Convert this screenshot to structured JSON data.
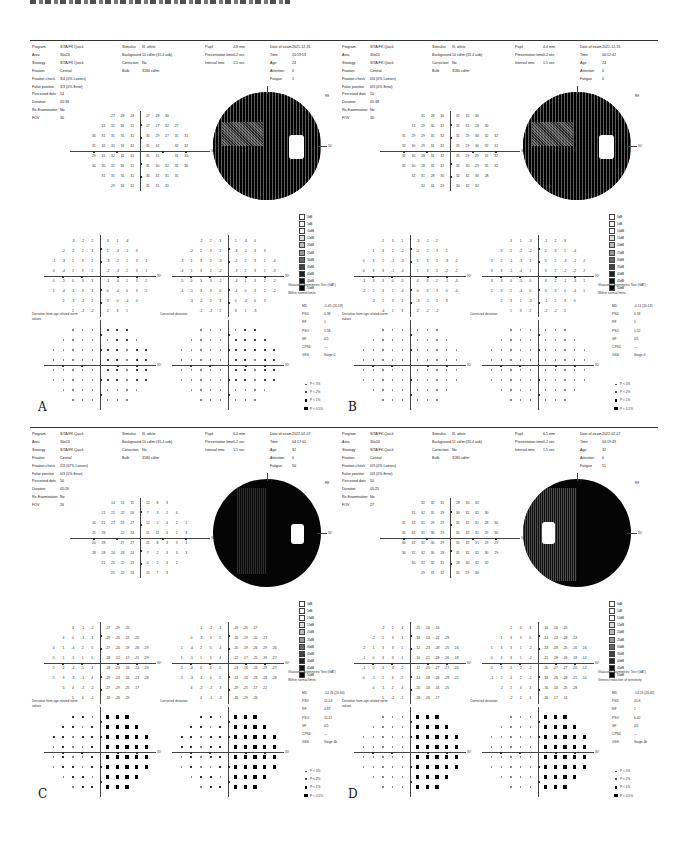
{
  "figure": {
    "caption_fragment": ""
  },
  "panels": [
    {
      "letter": "A",
      "header": {
        "program": "SITA/FK Quick",
        "area": "30x24",
        "strategy": "SITA/FK Quick",
        "fixation": "Central",
        "fixation_check": "3/4 (0% Losses)",
        "false_positive": "3/3 (0% Error)",
        "perceived_dots": "54",
        "duration": "05:38",
        "re_examination": "No",
        "fov": "30",
        "stimulus": "III, white",
        "background": "10 cd/m²(31.4 asb)",
        "correction": "No",
        "bulb": "3180 cd/m²",
        "pupil": "4.8 mm",
        "presentation_time": "0.2 sec",
        "interval_time": "1.5 sec",
        "date_of_exam": "2021-12-31",
        "time": "20:59:53",
        "age": "24",
        "attention": "0",
        "fatigue": "1"
      },
      "indices": {
        "ght": "Glaucoma Asymmetric Test (GAT)",
        "ght_result": "Within normal limits",
        "md": "-0.45 (20.18)",
        "psd": "0.38",
        "rf": "1",
        "pso": "1.58",
        "sf": "0/1",
        "cpsd": "—",
        "gss": "Stage 0"
      },
      "greymap_style": "patchy"
    },
    {
      "letter": "B",
      "header": {
        "program": "SITA/FK Quick",
        "area": "30x24",
        "strategy": "SITA/FK Quick",
        "fixation": "Central",
        "fixation_check": "0/4 (0% Losses)",
        "false_positive": "0/3 (0% Error)",
        "perceived_dots": "50",
        "duration": "05:38",
        "re_examination": "No",
        "fov": "30",
        "stimulus": "III, white",
        "background": "10 cd/m²(31.4 asb)",
        "correction": "No",
        "bulb": "3180 cd/m²",
        "pupil": "4.4 mm",
        "presentation_time": "0.2 sec",
        "interval_time": "1.5 sec",
        "date_of_exam": "2021-12-31",
        "time": "00:12:42",
        "age": "24",
        "attention": "0",
        "fatigue": "0"
      },
      "indices": {
        "ght": "Glaucoma Asymmetric Test (GAT)",
        "ght_result": "Within normal limits",
        "md": "-0.11 (20.18)",
        "psd": "0.58",
        "rf": "1",
        "pso": "1.52",
        "sf": "0/1",
        "cpsd": "—",
        "gss": "Stage 0"
      },
      "greymap_style": "patchy"
    },
    {
      "letter": "C",
      "header": {
        "program": "SITA/FK Quick",
        "area": "30x24",
        "strategy": "SITA/FK Quick",
        "fixation": "Central",
        "fixation_check": "2/3 (67% Losses)",
        "false_positive": "0/3 (0% Error)",
        "perceived_dots": "50",
        "duration": "05:26",
        "re_examination": "No",
        "fov": "26",
        "stimulus": "III, white",
        "background": "10 cd/m²(31.4 asb)",
        "correction": "No",
        "bulb": "3180 cd/m²",
        "pupil": "6.0 mm",
        "presentation_time": "0.2 sec",
        "interval_time": "1.5 sec",
        "date_of_exam": "2022-02-07",
        "time": "04:17:01",
        "age": "32",
        "attention": "0",
        "fatigue": "50"
      },
      "indices": {
        "ght": "Glaucoma Asymmetric Test (GAT)",
        "ght_result": "Within normal limits",
        "md": "-14.76 (20.60)",
        "psd": "15.03",
        "rf": "0.87",
        "pso": "15.11",
        "sf": "0/1",
        "cpsd": "—",
        "gss": "Stage 4b"
      },
      "greymap_style": "dark-left-patch"
    },
    {
      "letter": "D",
      "header": {
        "program": "SITA/FK Quick",
        "area": "30x24",
        "strategy": "SITA/FK Quick",
        "fixation": "Central",
        "fixation_check": "0/3 (0% Losses)",
        "false_positive": "0/3 (0% Error)",
        "perceived_dots": "50",
        "duration": "05:25",
        "re_examination": "No",
        "fov": "27",
        "stimulus": "III, white",
        "background": "11 cd/m²(31.4 asb)",
        "correction": "No",
        "bulb": "3180 cd/m²",
        "pupil": "6.5 mm",
        "presentation_time": "0.2 sec",
        "interval_time": "1.5 sec",
        "date_of_exam": "2022-02-07",
        "time": "04:19:49",
        "age": "32",
        "attention": "0",
        "fatigue": "51"
      },
      "indices": {
        "ght": "Glaucoma Asymmetric Test (GAT)",
        "ght_result": "General reduction of sensitivity",
        "md": "-14.23 (26.82)",
        "psd": "15.8",
        "rf": "1",
        "pso": "6.42",
        "sf": "0/1",
        "cpsd": "—",
        "gss": "Stage 4b"
      },
      "greymap_style": "dark-right-patch"
    }
  ],
  "labels": {
    "program": "Program",
    "area": "Area",
    "strategy": "Strategy",
    "fixation": "Fixation",
    "fixation_check": "Fixation check",
    "false_positive": "False positive",
    "perceived_dots": "Perceived dots",
    "duration": "Duration",
    "re_examination": "Re-Examination",
    "fov": "FOV",
    "stimulus": "Stimulus",
    "background": "Background",
    "correction": "Correction",
    "bulb": "Bulb",
    "pupil": "Pupil",
    "presentation_time": "Presentation time",
    "interval_time": "Interval time",
    "date_of_exam": "Date of exam",
    "time": "Time",
    "age": "Age",
    "attention": "Attention",
    "fatigue": "Fatigue",
    "md": "MD",
    "psd": "PSD",
    "rf": "RF",
    "pso": "PSO",
    "sf": "SF",
    "cpsd": "CPSD",
    "gss": "GSS",
    "deviation_total": "Deviation from age related norm values",
    "deviation_pattern": "Corrected deviation",
    "axis_30": "30°",
    "eye": "RE"
  },
  "greyscale_legend": [
    "0dB",
    "5dB",
    "10dB",
    "15dB",
    "20dB",
    "25dB",
    "30dB",
    "35dB",
    "40dB",
    "45dB",
    "50dB"
  ],
  "probability_legend": [
    "P < 5%",
    "P < 2%",
    "P < 1%",
    "P < 0.5%"
  ],
  "threshold_values": {
    "A": [
      [
        27,
        28,
        28,
        27,
        28,
        30
      ],
      [
        31,
        31,
        31,
        31,
        27,
        27,
        32,
        27
      ],
      [
        30,
        31,
        31,
        31,
        31,
        30,
        29,
        27,
        31,
        31
      ],
      [
        31,
        32,
        31,
        31,
        32,
        31,
        32,
        null,
        32,
        32
      ],
      [
        29,
        31,
        32,
        31,
        31,
        31,
        31,
        null,
        31,
        30
      ],
      [
        30,
        30,
        31,
        31,
        31,
        31,
        30,
        32,
        31,
        30
      ],
      [
        31,
        31,
        31,
        31,
        30,
        31,
        31,
        31
      ],
      [
        29,
        31,
        31,
        31,
        31,
        31
      ]
    ],
    "C": [
      [
        14,
        14,
        11,
        12,
        8,
        3
      ],
      [
        21,
        22,
        22,
        26,
        7,
        3,
        2,
        4
      ],
      [
        24,
        21,
        27,
        19,
        27,
        12,
        5,
        4,
        2,
        1
      ],
      [
        25,
        26,
        null,
        22,
        24,
        11,
        11,
        4,
        2,
        3
      ],
      [
        20,
        28,
        null,
        27,
        27,
        21,
        8,
        3,
        3,
        3
      ],
      [
        28,
        28,
        24,
        18,
        24,
        7,
        2,
        3,
        3,
        3
      ],
      [
        21,
        25,
        22,
        19,
        4,
        2,
        3,
        2
      ],
      [
        21,
        22,
        16,
        15,
        7,
        3
      ]
    ]
  }
}
